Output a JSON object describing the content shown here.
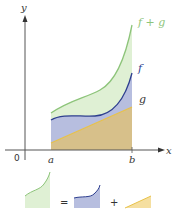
{
  "figure": {
    "axes": {
      "x_label": "x",
      "y_label": "y",
      "origin_label": "0"
    },
    "ticks": {
      "a_label": "a",
      "b_label": "b"
    },
    "curves": {
      "f_plus_g": {
        "label": "f + g",
        "color": "#8dc47a",
        "fill": "#dff0d4"
      },
      "f": {
        "label": "f",
        "color": "#2e3f8f",
        "fill": "#b7bedf"
      },
      "g": {
        "label": "g",
        "color": "#e8c24a",
        "fill": "#d7c08a"
      }
    },
    "equation": {
      "equals": "=",
      "plus": "+"
    }
  }
}
